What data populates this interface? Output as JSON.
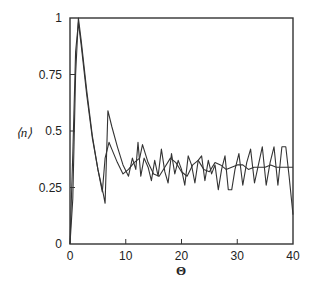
{
  "chart_data": {
    "type": "line",
    "title": "",
    "xlabel": "Θ",
    "ylabel": "⟨n⟩",
    "xlim": [
      0,
      40
    ],
    "ylim": [
      0,
      1
    ],
    "xticks": [
      0,
      10,
      20,
      30,
      40
    ],
    "xtick_labels": [
      "0",
      "10",
      "20",
      "30",
      "40"
    ],
    "yticks": [
      0,
      0.25,
      0.5,
      0.75,
      1
    ],
    "ytick_labels": [
      "0",
      "0.25",
      "0.5",
      "0.75",
      "1"
    ],
    "grid": false,
    "legend": null,
    "series": [
      {
        "name": "oscillating",
        "color": "#333333",
        "x": [
          0,
          0.5,
          1,
          1.5,
          2,
          3,
          4,
          5,
          6,
          6.3,
          6.8,
          7.5,
          8.5,
          9.5,
          10.5,
          11.2,
          11.8,
          12.2,
          12.7,
          13.3,
          14,
          14.6,
          15.2,
          15.8,
          16.4,
          17,
          17.6,
          18.2,
          18.8,
          19.4,
          20,
          20.6,
          21.2,
          21.8,
          22.4,
          23,
          23.6,
          24.2,
          24.8,
          25.4,
          26,
          26.6,
          27.2,
          27.8,
          28.4,
          29,
          29.6,
          30.3,
          31,
          31.7,
          32.4,
          33.1,
          33.8,
          34.5,
          35.2,
          35.9,
          36.6,
          37.3,
          38,
          38.7,
          39.3,
          40
        ],
        "y": [
          0,
          0.4,
          0.85,
          0.98,
          0.88,
          0.66,
          0.47,
          0.33,
          0.22,
          0.18,
          0.59,
          0.52,
          0.43,
          0.35,
          0.3,
          0.38,
          0.33,
          0.45,
          0.3,
          0.38,
          0.34,
          0.28,
          0.37,
          0.3,
          0.42,
          0.32,
          0.27,
          0.4,
          0.31,
          0.37,
          0.33,
          0.26,
          0.39,
          0.35,
          0.27,
          0.37,
          0.39,
          0.28,
          0.37,
          0.31,
          0.35,
          0.24,
          0.33,
          0.39,
          0.24,
          0.24,
          0.33,
          0.4,
          0.26,
          0.36,
          0.42,
          0.27,
          0.35,
          0.43,
          0.26,
          0.36,
          0.43,
          0.26,
          0.43,
          0.43,
          0.3,
          0.13
        ]
      },
      {
        "name": "damped",
        "color": "#333333",
        "x": [
          0,
          0.5,
          1,
          1.5,
          2,
          3,
          4,
          5,
          5.8,
          6.3,
          7,
          7.5,
          8.5,
          9.5,
          10.5,
          11.5,
          12.5,
          13,
          14,
          15,
          16,
          17,
          18,
          19,
          20,
          21,
          22,
          23,
          24,
          25,
          26,
          27,
          28,
          29,
          30,
          31,
          32,
          33,
          34,
          35,
          36,
          37,
          38,
          39,
          40
        ],
        "y": [
          0,
          0.2,
          0.75,
          1.0,
          0.9,
          0.68,
          0.48,
          0.33,
          0.23,
          0.38,
          0.45,
          0.42,
          0.36,
          0.31,
          0.33,
          0.36,
          0.38,
          0.44,
          0.36,
          0.31,
          0.3,
          0.34,
          0.38,
          0.36,
          0.32,
          0.3,
          0.35,
          0.37,
          0.33,
          0.32,
          0.36,
          0.35,
          0.33,
          0.34,
          0.35,
          0.35,
          0.33,
          0.34,
          0.34,
          0.34,
          0.35,
          0.34,
          0.34,
          0.34,
          0.34
        ]
      }
    ]
  }
}
